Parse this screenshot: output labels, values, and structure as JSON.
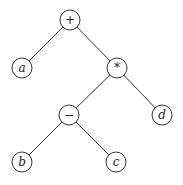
{
  "diagram": {
    "type": "expression-tree",
    "nodes": [
      {
        "id": "plus",
        "label": "+",
        "x": 70,
        "y": 20,
        "italic": false
      },
      {
        "id": "a",
        "label": "a",
        "x": 22,
        "y": 68,
        "italic": true
      },
      {
        "id": "times",
        "label": "*",
        "x": 117,
        "y": 68,
        "italic": false
      },
      {
        "id": "minus",
        "label": "−",
        "x": 69,
        "y": 115,
        "italic": false
      },
      {
        "id": "d",
        "label": "d",
        "x": 162,
        "y": 115,
        "italic": true
      },
      {
        "id": "b",
        "label": "b",
        "x": 22,
        "y": 162,
        "italic": true
      },
      {
        "id": "c",
        "label": "c",
        "x": 116,
        "y": 162,
        "italic": true
      }
    ],
    "edges": [
      [
        "plus",
        "a"
      ],
      [
        "plus",
        "times"
      ],
      [
        "times",
        "minus"
      ],
      [
        "times",
        "d"
      ],
      [
        "minus",
        "b"
      ],
      [
        "minus",
        "c"
      ]
    ],
    "radius": 10
  }
}
